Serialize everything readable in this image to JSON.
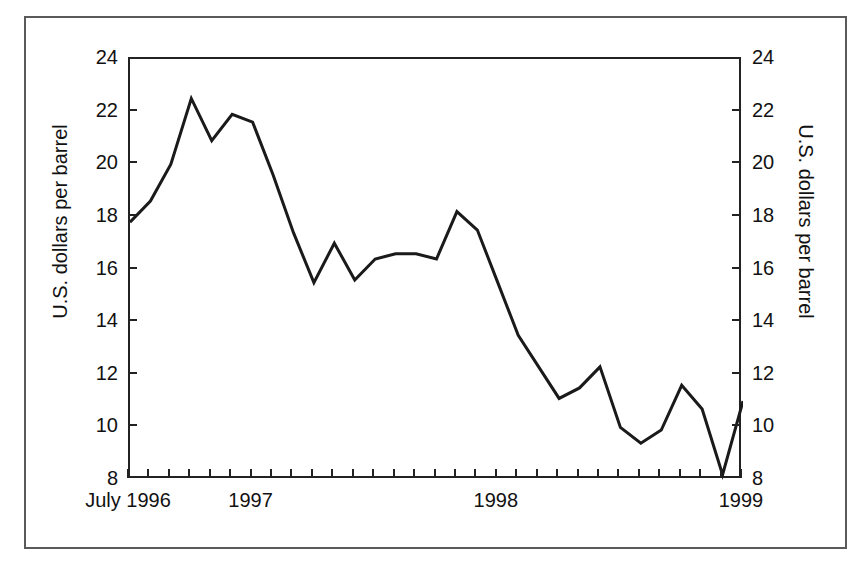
{
  "chart_data": {
    "type": "line",
    "title": "",
    "subtitle": "",
    "xlabel": "",
    "ylabel": "U.S. dollars per barrel",
    "ylabel_right": "U.S. dollars per barrel",
    "ylim": [
      8,
      24
    ],
    "yticks": [
      8,
      10,
      12,
      14,
      16,
      18,
      20,
      22,
      24
    ],
    "ytick_labels": [
      "8",
      "10",
      "12",
      "14",
      "16",
      "18",
      "20",
      "22",
      "24"
    ],
    "grid": false,
    "legend": false,
    "legend_position": "none",
    "x_tick_count": 31,
    "x_axis_labels": [
      {
        "text": "July 1996",
        "index": 0
      },
      {
        "text": "1997",
        "index": 6
      },
      {
        "text": "1998",
        "index": 18
      },
      {
        "text": "1999",
        "index": 30
      }
    ],
    "x": [
      "Jul 1996",
      "Aug 1996",
      "Sep 1996",
      "Oct 1996",
      "Nov 1996",
      "Dec 1996",
      "Jan 1997",
      "Feb 1997",
      "Mar 1997",
      "Apr 1997",
      "May 1997",
      "Jun 1997",
      "Jul 1997",
      "Aug 1997",
      "Sep 1997",
      "Oct 1997",
      "Nov 1997",
      "Dec 1997",
      "Jan 1998",
      "Feb 1998",
      "Mar 1998",
      "Apr 1998",
      "May 1998",
      "Jun 1998",
      "Jul 1998",
      "Aug 1998",
      "Sep 1998",
      "Oct 1998",
      "Nov 1998",
      "Dec 1998",
      "Jan 1999"
    ],
    "values": [
      17.8,
      18.6,
      20.0,
      22.5,
      20.9,
      21.9,
      21.6,
      19.6,
      17.4,
      15.5,
      17.0,
      15.6,
      16.4,
      16.6,
      16.6,
      16.4,
      18.2,
      17.5,
      15.5,
      13.5,
      12.3,
      11.1,
      11.5,
      12.3,
      10.0,
      9.4,
      9.9,
      11.6,
      10.7,
      8.2,
      11.0
    ],
    "series": [
      {
        "name": "Crude oil price",
        "color": "#1a1a1a",
        "line_width": 3,
        "values": [
          17.8,
          18.6,
          20.0,
          22.5,
          20.9,
          21.9,
          21.6,
          19.6,
          17.4,
          15.5,
          17.0,
          15.6,
          16.4,
          16.6,
          16.6,
          16.4,
          18.2,
          17.5,
          15.5,
          13.5,
          12.3,
          11.1,
          11.5,
          12.3,
          10.0,
          9.4,
          9.9,
          11.6,
          10.7,
          8.2,
          11.0
        ]
      }
    ],
    "colors": {
      "line": "#1a1a1a",
      "axis": "#222222",
      "frame": "#5a5a5a",
      "background": "#ffffff",
      "text": "#111111"
    }
  }
}
